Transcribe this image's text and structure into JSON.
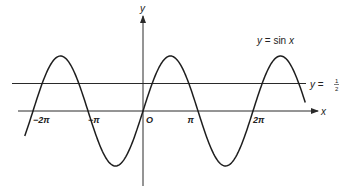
{
  "chart_data": {
    "type": "line",
    "title": "",
    "xlabel": "x",
    "ylabel": "y",
    "origin_label": "O",
    "xlim": [
      -2.65,
      3.2
    ],
    "ylim": [
      -1.3,
      1.55
    ],
    "grid": false,
    "x_ticks": [
      {
        "value": -2,
        "label": "−2π"
      },
      {
        "value": -1,
        "label": "−π"
      },
      {
        "value": 1,
        "label": "π"
      },
      {
        "value": 2,
        "label": "2π"
      }
    ],
    "x_unit": "π",
    "series": [
      {
        "name": "y = sin x",
        "function": "sin(x)",
        "x_range_in_pi": [
          -2.15,
          2.95
        ],
        "label_parts": {
          "lhs": "y",
          "eq": " = sin ",
          "var": "x"
        }
      }
    ],
    "horizontal_lines": [
      {
        "name": "y = 1/2",
        "y": 0.5,
        "label_lhs": "y",
        "label_eq": " = ",
        "label_num": "1",
        "label_den": "2"
      }
    ]
  }
}
